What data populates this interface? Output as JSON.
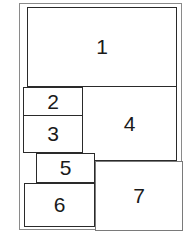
{
  "diagram": {
    "type": "page-layout",
    "regions": [
      {
        "id": "1",
        "label": "1"
      },
      {
        "id": "2",
        "label": "2"
      },
      {
        "id": "3",
        "label": "3"
      },
      {
        "id": "4",
        "label": "4"
      },
      {
        "id": "5",
        "label": "5"
      },
      {
        "id": "6",
        "label": "6"
      },
      {
        "id": "7",
        "label": "7"
      }
    ],
    "colors": {
      "stroke_dark": "#2a2a2a",
      "stroke_light": "#7a7a7a",
      "text": "#1a1a1a",
      "background": "#ffffff"
    }
  }
}
